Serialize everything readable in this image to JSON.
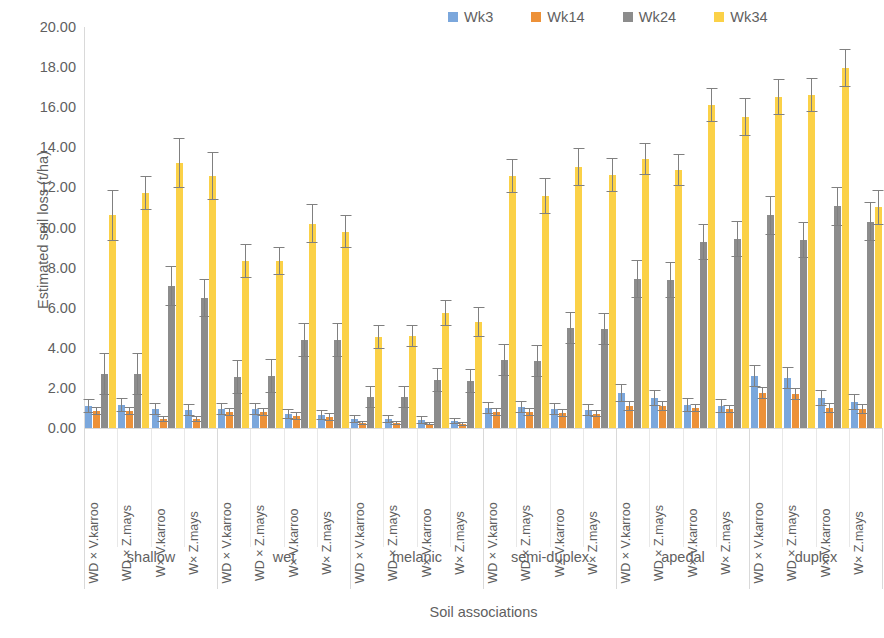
{
  "legend": {
    "position": "top-right",
    "items": [
      {
        "label": "Wk3",
        "color": "#7BA7DC",
        "icon": "legend-swatch"
      },
      {
        "label": "Wk14",
        "color": "#ED9138",
        "icon": "legend-swatch"
      },
      {
        "label": "Wk24",
        "color": "#8C8C8C",
        "icon": "legend-swatch"
      },
      {
        "label": "Wk34",
        "color": "#FBD147",
        "icon": "legend-swatch"
      }
    ]
  },
  "axes": {
    "ylabel": "Estimated soil loss (t/ha)",
    "xlabel": "Soil associations",
    "yticks": [
      "0.00",
      "2.00",
      "4.00",
      "6.00",
      "8.00",
      "10.00",
      "12.00",
      "14.00",
      "16.00",
      "18.00",
      "20.00"
    ],
    "ymin": 0,
    "ymax": 20,
    "ystep": 2
  },
  "chart_data": {
    "type": "bar",
    "title": "",
    "xlabel": "Soil associations",
    "ylabel": "Estimated soil loss (t/ha)",
    "ylim": [
      0,
      20
    ],
    "ytick_step": 2,
    "grid": false,
    "legend_position": "top-right",
    "error_bars": "standard deviation",
    "group_labels": [
      "shallow",
      "wet",
      "melanic",
      "semi-duplex",
      "apedal",
      "duplex"
    ],
    "categories": [
      "WD × V.karroo",
      "WD × Z.mays",
      "W× V.karroo",
      "W× Z.mays",
      "WD × V.karroo",
      "WD × Z.mays",
      "W× V.karroo",
      "W× Z.mays",
      "WD × V.karroo",
      "WD × Z.mays",
      "W× V.karroo",
      "W× Z.mays",
      "WD × V.karroo",
      "WD × Z.mays",
      "W× V.karroo",
      "W× Z.mays",
      "WD × V.karroo",
      "WD × Z.mays",
      "W× V.karroo",
      "W× Z.mays",
      "WD × V.karroo",
      "WD × Z.mays",
      "W× V.karroo",
      "W× Z.mays"
    ],
    "series": [
      {
        "name": "Wk3",
        "color": "#7BA7DC",
        "values": [
          1.1,
          1.15,
          0.95,
          0.9,
          0.95,
          0.95,
          0.7,
          0.65,
          0.45,
          0.45,
          0.4,
          0.35,
          1.0,
          1.05,
          0.95,
          0.9,
          1.75,
          1.5,
          1.15,
          1.1,
          2.6,
          2.5,
          1.5,
          1.3
        ],
        "errors": [
          0.35,
          0.35,
          0.3,
          0.3,
          0.3,
          0.3,
          0.25,
          0.25,
          0.2,
          0.2,
          0.18,
          0.15,
          0.3,
          0.3,
          0.3,
          0.28,
          0.45,
          0.4,
          0.35,
          0.33,
          0.55,
          0.55,
          0.4,
          0.38
        ]
      },
      {
        "name": "Wk14",
        "color": "#ED9138",
        "values": [
          0.85,
          0.85,
          0.45,
          0.45,
          0.8,
          0.8,
          0.6,
          0.55,
          0.25,
          0.25,
          0.22,
          0.2,
          0.8,
          0.8,
          0.75,
          0.72,
          1.1,
          1.1,
          1.0,
          0.95,
          1.75,
          1.7,
          1.0,
          0.95
        ],
        "errors": [
          0.2,
          0.2,
          0.15,
          0.15,
          0.2,
          0.2,
          0.18,
          0.18,
          0.1,
          0.1,
          0.08,
          0.08,
          0.2,
          0.2,
          0.18,
          0.18,
          0.25,
          0.25,
          0.22,
          0.22,
          0.3,
          0.3,
          0.25,
          0.25
        ]
      },
      {
        "name": "Wk24",
        "color": "#8C8C8C",
        "values": [
          2.7,
          2.7,
          7.1,
          6.5,
          2.55,
          2.6,
          4.4,
          4.4,
          1.55,
          1.55,
          2.4,
          2.35,
          3.4,
          3.35,
          5.0,
          4.95,
          7.45,
          7.4,
          9.3,
          9.45,
          10.6,
          9.4,
          11.05,
          10.3
        ],
        "errors": [
          1.05,
          1.05,
          1.0,
          0.95,
          0.85,
          0.85,
          0.85,
          0.85,
          0.55,
          0.55,
          0.6,
          0.6,
          0.8,
          0.8,
          0.8,
          0.8,
          0.95,
          0.9,
          0.9,
          0.9,
          0.95,
          0.9,
          0.95,
          0.95
        ]
      },
      {
        "name": "Wk34",
        "color": "#FBD147",
        "values": [
          10.6,
          11.7,
          13.2,
          12.55,
          8.35,
          8.35,
          10.2,
          9.8,
          4.55,
          4.6,
          5.75,
          5.3,
          12.55,
          11.55,
          13.0,
          12.6,
          13.4,
          12.85,
          16.1,
          15.5,
          16.5,
          16.6,
          17.95,
          11.0
        ],
        "errors": [
          1.25,
          0.85,
          1.25,
          1.2,
          0.85,
          0.7,
          0.95,
          0.8,
          0.6,
          0.55,
          0.65,
          0.75,
          0.85,
          0.9,
          0.95,
          0.85,
          0.8,
          0.8,
          0.85,
          0.95,
          0.9,
          0.85,
          0.95,
          0.85
        ]
      }
    ]
  }
}
